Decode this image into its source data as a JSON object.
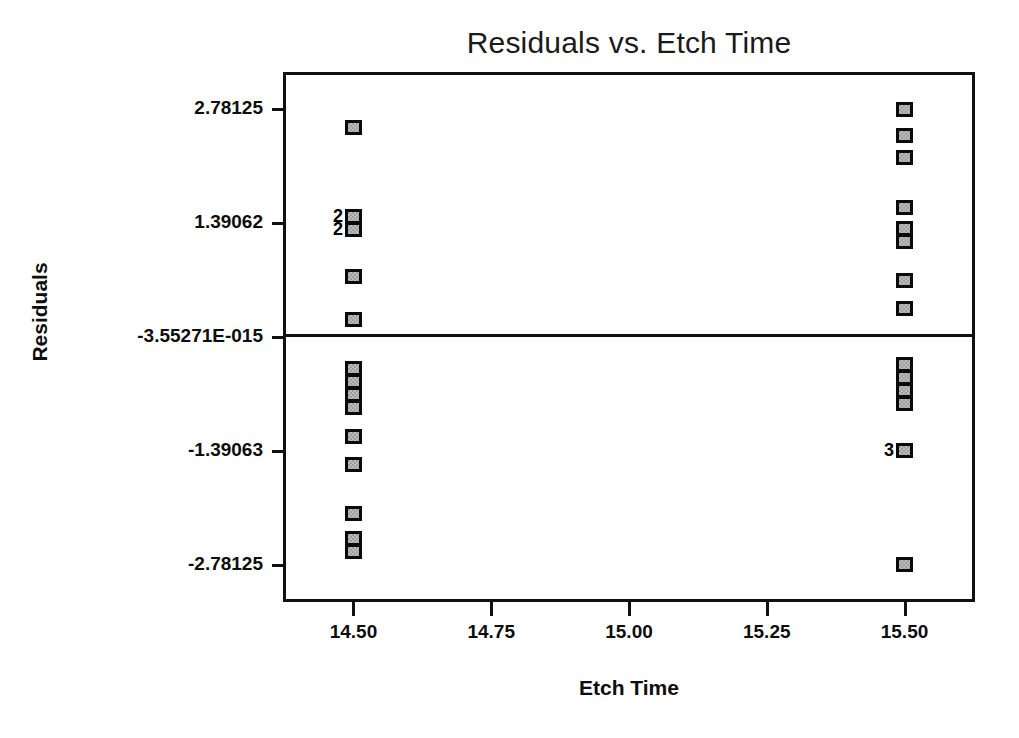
{
  "chart_data": {
    "type": "scatter",
    "title": "Residuals vs. Etch Time",
    "xlabel": "Etch Time",
    "ylabel": "Residuals",
    "grid": false,
    "legend": null,
    "xlim": [
      14.3775,
      15.6225
    ],
    "ylim": [
      -3.2,
      3.2
    ],
    "xticks": [
      "14.50",
      "14.75",
      "15.00",
      "15.25",
      "15.50"
    ],
    "xtick_values": [
      14.5,
      14.75,
      15.0,
      15.25,
      15.5
    ],
    "yticks": [
      "2.78125",
      "1.39062",
      "-3.55271E-015",
      "-1.39063",
      "-2.78125"
    ],
    "ytick_values": [
      2.78125,
      1.39062,
      0,
      -1.39063,
      -2.78125
    ],
    "reference_line": {
      "y": 0,
      "label": "-3.55271E-015"
    },
    "marker_style": "filled-square-gray",
    "overlap_labels_note": "Numeric label left of a marker gives the count of coincident points",
    "series": [
      {
        "name": "Residuals",
        "points": [
          {
            "x": 14.5,
            "y": 2.56,
            "count": 1
          },
          {
            "x": 14.5,
            "y": 1.47,
            "count": 2
          },
          {
            "x": 14.5,
            "y": 1.31,
            "count": 2
          },
          {
            "x": 14.5,
            "y": 0.74,
            "count": 1
          },
          {
            "x": 14.5,
            "y": 0.21,
            "count": 1
          },
          {
            "x": 14.5,
            "y": -0.38,
            "count": 1
          },
          {
            "x": 14.5,
            "y": -0.54,
            "count": 1
          },
          {
            "x": 14.5,
            "y": -0.7,
            "count": 1
          },
          {
            "x": 14.5,
            "y": -0.86,
            "count": 1
          },
          {
            "x": 14.5,
            "y": -1.21,
            "count": 1
          },
          {
            "x": 14.5,
            "y": -1.56,
            "count": 1
          },
          {
            "x": 14.5,
            "y": -2.15,
            "count": 1
          },
          {
            "x": 14.5,
            "y": -2.46,
            "count": 1
          },
          {
            "x": 14.5,
            "y": -2.62,
            "count": 1
          },
          {
            "x": 15.5,
            "y": 2.78,
            "count": 1
          },
          {
            "x": 15.5,
            "y": 2.46,
            "count": 1
          },
          {
            "x": 15.5,
            "y": 2.19,
            "count": 1
          },
          {
            "x": 15.5,
            "y": 1.58,
            "count": 1
          },
          {
            "x": 15.5,
            "y": 1.33,
            "count": 1
          },
          {
            "x": 15.5,
            "y": 1.17,
            "count": 1
          },
          {
            "x": 15.5,
            "y": 0.69,
            "count": 1
          },
          {
            "x": 15.5,
            "y": 0.35,
            "count": 1
          },
          {
            "x": 15.5,
            "y": -0.33,
            "count": 1
          },
          {
            "x": 15.5,
            "y": -0.49,
            "count": 1
          },
          {
            "x": 15.5,
            "y": -0.65,
            "count": 1
          },
          {
            "x": 15.5,
            "y": -0.81,
            "count": 1
          },
          {
            "x": 15.5,
            "y": -1.39,
            "count": 3
          },
          {
            "x": 15.5,
            "y": -2.78,
            "count": 1
          }
        ]
      }
    ]
  }
}
